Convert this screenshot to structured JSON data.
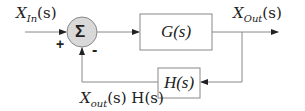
{
  "diagram": {
    "type": "feedback-control-block-diagram",
    "input_label": {
      "main": "X",
      "sub": "In",
      "arg": "(s)"
    },
    "output_label": {
      "main": "X",
      "sub": "Out",
      "arg": "(s)"
    },
    "feedback_label": {
      "main": "X",
      "sub": "out",
      "arg": "(s) H(s)"
    },
    "summing_junction": {
      "symbol": "Σ",
      "plus": "+",
      "minus": "-"
    },
    "forward_block": "G(s)",
    "feedback_block": "H(s)",
    "colors": {
      "line": "#888888",
      "junction_fill": "#d9d9d9",
      "text": "#222222"
    }
  }
}
